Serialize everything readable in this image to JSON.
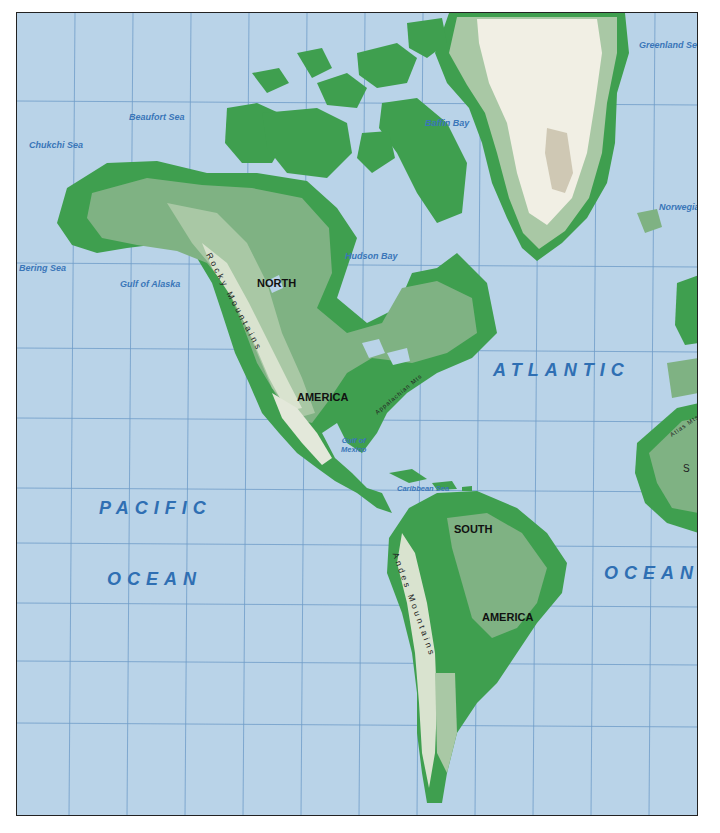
{
  "map": {
    "title": "Physical map of the Americas",
    "colors": {
      "ocean": "#b9d3e8",
      "grid": "#6e9cc8",
      "lowland": "#3f9f4f",
      "plain": "#7fb283",
      "upland": "#a9c8a5",
      "highland": "#d9e3cf",
      "ice": "#f1efe4",
      "ice_peak": "#cfc8b4",
      "label_water": "#3a76b8",
      "label_land": "#111111"
    },
    "ocean_labels": {
      "pacific_line1": "PACIFIC",
      "pacific_line2": "OCEAN",
      "atlantic_line1": "ATLANTIC",
      "atlantic_line2": "OCEAN"
    },
    "sea_labels": {
      "chukchi": "Chukchi Sea",
      "beaufort": "Beaufort Sea",
      "baffin": "Baffin Bay",
      "greenland": "Greenland Sea",
      "norwegian": "Norwegia",
      "bering": "Bering Sea",
      "alaska": "Gulf of Alaska",
      "hudson": "Hudson Bay",
      "mexico_line1": "Gulf of",
      "mexico_line2": "Mexico",
      "caribbean": "Caribbean Sea"
    },
    "continent_labels": {
      "north_line1": "NORTH",
      "north_line2": "AMERICA",
      "south_line1": "SOUTH",
      "south_line2": "AMERICA",
      "sahara_partial": "S a"
    },
    "mountain_labels": {
      "rockies": "Rocky Mountains",
      "andes": "Andes Mountains",
      "appalachian": "Appalachian Mts",
      "atlas": "Atlas Mts"
    }
  }
}
